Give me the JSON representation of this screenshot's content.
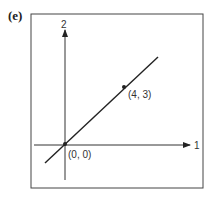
{
  "figure": {
    "panel_label": "(e)",
    "axes": {
      "x_axis_label": "1",
      "y_axis_label": "2"
    },
    "points": [
      {
        "label": "(0, 0)",
        "x": 0,
        "y": 0
      },
      {
        "label": "(4, 3)",
        "x": 4,
        "y": 3
      }
    ],
    "line": "straight line through (0, 0) and (4, 3)",
    "colors": {
      "ink": "#222222",
      "background": "#ffffff"
    }
  }
}
